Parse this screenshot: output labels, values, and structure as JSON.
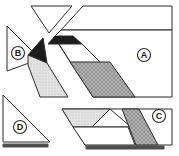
{
  "figure": {
    "description_labels": [
      "A",
      "B",
      "C",
      "D"
    ],
    "colors": {
      "background": "#ffffff",
      "outline": "#2a2a2a",
      "ink": "#1c1c1c",
      "shadow": "#4f4f4f",
      "hatch_base": "#b4b4b4",
      "hatch_line": "#878787",
      "stipple_base": "#e3e3e3",
      "stipple_dot": "#bcbcbc",
      "white": "#ffffff"
    },
    "shapes": [
      {
        "name": "corner-triangle",
        "fill": "white",
        "points": "31,6 72,6 49,33"
      },
      {
        "name": "piece-a-top-strip",
        "fill": "white",
        "points": "83,6 172,6 172,30 61,30"
      },
      {
        "name": "piece-a-main",
        "fill": "white",
        "points": "61,30 172,30 172,97 93,97 54,37"
      },
      {
        "name": "black-parallelogram",
        "fill": "ink",
        "points": "55,36 73,36 82,44 48,44"
      },
      {
        "name": "white-parallelogram",
        "fill": "white",
        "points": "59,44 82,44 101,63 71,63"
      },
      {
        "name": "hatched-parallelogram-a",
        "fill": "hatch",
        "points": "70,62 110,62 135,97 93,97"
      },
      {
        "name": "piece-b-triangle",
        "fill": "white",
        "points": "7,26 7,71 40,59"
      },
      {
        "name": "dark-triangle-b",
        "fill": "ink",
        "points": "43,38 47,63 28,55"
      },
      {
        "name": "stippled-polygon-b",
        "fill": "stipple",
        "points": "28,55 47,63 68,97 40,97 28,65"
      },
      {
        "name": "piece-d-triangle",
        "fill": "white",
        "points": "3,95 3,142 50,142"
      },
      {
        "name": "shadow-bar-d",
        "fill": "shadow",
        "points": "3,144 48,144 48,147 3,147"
      },
      {
        "name": "piece-c-body",
        "fill": "white",
        "points": "62,109 172,109 172,145 85,145"
      },
      {
        "name": "stippled-parallelogram-c",
        "fill": "stipple",
        "points": "62,109 110,109 92,127 73,127"
      },
      {
        "name": "white-triangle-c",
        "fill": "white",
        "points": "110,109 131,127 92,127"
      },
      {
        "name": "bottom-band-c",
        "fill": "white",
        "points": "73,127 128,127 135,145 85,145"
      },
      {
        "name": "hatched-parallelogram-c",
        "fill": "hatch",
        "points": "122,109 139,109 158,145 136,145"
      },
      {
        "name": "shadow-bar-c",
        "fill": "shadow",
        "points": "86,146 164,146 164,149 86,149"
      }
    ],
    "labels": [
      {
        "letter": "A",
        "x": 144,
        "y": 55,
        "r": 6.5
      },
      {
        "letter": "B",
        "x": 18,
        "y": 53,
        "r": 6.5
      },
      {
        "letter": "C",
        "x": 159,
        "y": 116,
        "r": 6.5
      },
      {
        "letter": "D",
        "x": 20,
        "y": 127,
        "r": 6.5
      }
    ]
  }
}
